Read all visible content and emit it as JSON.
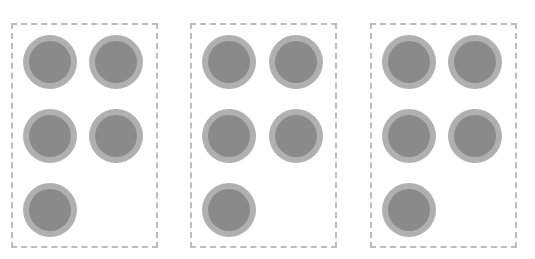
{
  "diagram": {
    "colors": {
      "border": "#bdbdbd",
      "circle_ring": "#b0b0b0",
      "circle_fill": "#8a8a8a"
    },
    "groups": [
      {
        "id": "group-1",
        "count": 5
      },
      {
        "id": "group-2",
        "count": 5
      },
      {
        "id": "group-3",
        "count": 5
      }
    ]
  }
}
